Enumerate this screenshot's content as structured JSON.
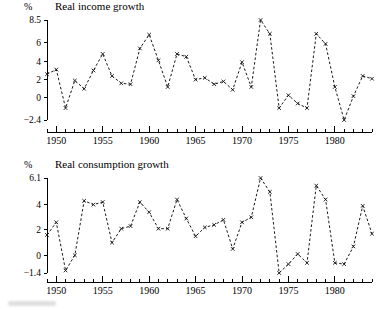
{
  "figure": {
    "background": "#ffffff",
    "ink_color": "#111111",
    "marker_glyph": "x",
    "line_style": "dashed"
  },
  "panels": [
    {
      "id": "income",
      "unit_label": "%",
      "title": "Real income growth",
      "chart_ref": 0
    },
    {
      "id": "consumption",
      "unit_label": "%",
      "title": "Real consumption growth",
      "chart_ref": 1
    }
  ],
  "chart_data": [
    {
      "type": "line",
      "title": "Real income growth",
      "xlabel": "",
      "ylabel": "%",
      "ylim": [
        -2.4,
        8.5
      ],
      "xlim": [
        1949,
        1984
      ],
      "grid": false,
      "legend": "none",
      "marker": "x",
      "linestyle": "dashed",
      "ytick_labels": [
        "8.5",
        "6",
        "4",
        "2",
        "0",
        "-2.4"
      ],
      "ytick_values": [
        8.5,
        6,
        4,
        2,
        0,
        -2.4
      ],
      "xtick_labels": [
        "1950",
        "1955",
        "1960",
        "1965",
        "1970",
        "1975",
        "1980"
      ],
      "xtick_values": [
        1950,
        1955,
        1960,
        1965,
        1970,
        1975,
        1980
      ],
      "xtick_minor_step": 1,
      "x": [
        1949,
        1950,
        1951,
        1952,
        1953,
        1954,
        1955,
        1956,
        1957,
        1958,
        1959,
        1960,
        1961,
        1962,
        1963,
        1964,
        1965,
        1966,
        1967,
        1968,
        1969,
        1970,
        1971,
        1972,
        1973,
        1974,
        1975,
        1976,
        1977,
        1978,
        1979,
        1980,
        1981,
        1982,
        1983,
        1984
      ],
      "values": [
        2.6,
        3.1,
        -1.1,
        1.9,
        1.0,
        3.0,
        4.8,
        2.4,
        1.6,
        1.5,
        5.4,
        6.9,
        4.1,
        1.2,
        4.8,
        4.5,
        2.0,
        2.2,
        1.5,
        1.8,
        0.9,
        3.9,
        1.2,
        8.5,
        7.0,
        -1.1,
        0.3,
        -0.6,
        -1.1,
        7.0,
        5.9,
        1.2,
        -2.4,
        0.2,
        2.4,
        2.1
      ]
    },
    {
      "type": "line",
      "title": "Real consumption growth",
      "xlabel": "",
      "ylabel": "%",
      "ylim": [
        -1.4,
        6.1
      ],
      "xlim": [
        1949,
        1984
      ],
      "grid": false,
      "legend": "none",
      "marker": "x",
      "linestyle": "dashed",
      "ytick_labels": [
        "6.1",
        "4",
        "2",
        "0",
        "-1.4"
      ],
      "ytick_values": [
        6.1,
        4,
        2,
        0,
        -1.4
      ],
      "xtick_labels": [
        "1950",
        "1955",
        "1960",
        "1965",
        "1970",
        "1975",
        "1980"
      ],
      "xtick_values": [
        1950,
        1955,
        1960,
        1965,
        1970,
        1975,
        1980
      ],
      "xtick_minor_step": 1,
      "x": [
        1949,
        1950,
        1951,
        1952,
        1953,
        1954,
        1955,
        1956,
        1957,
        1958,
        1959,
        1960,
        1961,
        1962,
        1963,
        1964,
        1965,
        1966,
        1967,
        1968,
        1969,
        1970,
        1971,
        1972,
        1973,
        1974,
        1975,
        1976,
        1977,
        1978,
        1979,
        1980,
        1981,
        1982,
        1983,
        1984
      ],
      "values": [
        1.6,
        2.6,
        -1.2,
        0.0,
        4.3,
        4.0,
        4.2,
        1.0,
        2.1,
        2.3,
        4.2,
        3.4,
        2.1,
        2.1,
        4.4,
        2.9,
        1.5,
        2.2,
        2.4,
        2.8,
        0.5,
        2.6,
        3.0,
        6.1,
        5.0,
        -1.4,
        -0.7,
        0.1,
        -0.6,
        5.5,
        4.4,
        -0.6,
        -0.7,
        0.7,
        3.9,
        1.7
      ]
    }
  ]
}
